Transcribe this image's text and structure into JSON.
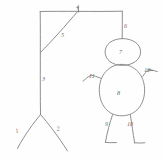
{
  "figure": {
    "style": {
      "stroke_color": "#8f8f8f",
      "label_color": "#6e6e6e",
      "background": "#fefefe"
    },
    "parts": [
      {
        "id": "1",
        "name": "base-leg-left",
        "label": "1",
        "x": 16,
        "y": 133,
        "rotate": -18
      },
      {
        "id": "2",
        "name": "base-leg-right",
        "label": "2",
        "x": 57,
        "y": 131,
        "rotate": -12
      },
      {
        "id": "3",
        "name": "vertical-post",
        "label": "3",
        "x": 42,
        "y": 81,
        "rotate": 0
      },
      {
        "id": "4",
        "name": "beam-joint",
        "label": "4",
        "x": 76,
        "y": 9,
        "rotate": 0
      },
      {
        "id": "5",
        "name": "diagonal-brace",
        "label": "5",
        "x": 61,
        "y": 37,
        "rotate": 0
      },
      {
        "id": "6",
        "name": "rope",
        "label": "6",
        "x": 124,
        "y": 28,
        "rotate": 0
      },
      {
        "id": "7",
        "name": "head",
        "label": "7",
        "x": 119,
        "y": 54,
        "rotate": 0
      },
      {
        "id": "8",
        "name": "body",
        "label": "8",
        "x": 117,
        "y": 95,
        "rotate": 0
      },
      {
        "id": "9",
        "name": "leg-left",
        "label": "9",
        "x": 105,
        "y": 126,
        "rotate": 0
      },
      {
        "id": "10",
        "name": "leg-right",
        "label": "10",
        "x": 127,
        "y": 126,
        "rotate": 0
      },
      {
        "id": "11",
        "name": "arm-left",
        "label": "11",
        "x": 89,
        "y": 78,
        "rotate": 0
      },
      {
        "id": "12",
        "name": "arm-right",
        "label": "12",
        "x": 144,
        "y": 72,
        "rotate": 0
      }
    ]
  }
}
